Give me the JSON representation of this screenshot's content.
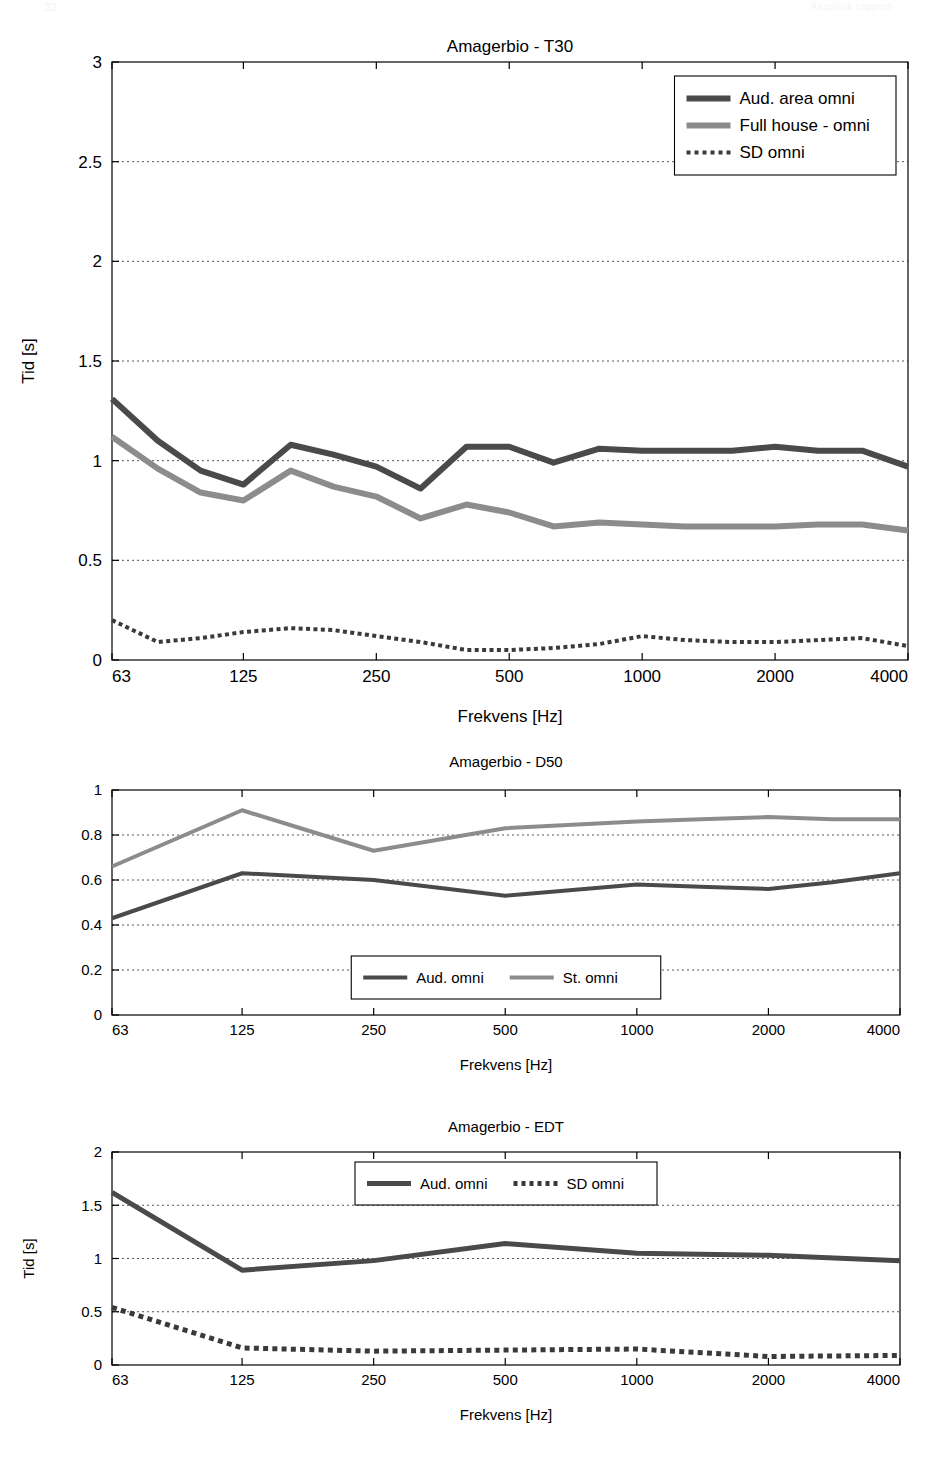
{
  "header": {
    "left_mark": "32",
    "right_mark": "Akustisk rapport"
  },
  "figures": [
    {
      "id": "fig-t30",
      "title": "Amagerbio - T30",
      "xlabel": "Frekvens [Hz]",
      "ylabel": "Tid [s]",
      "legend_position": "top-right",
      "chart_data": {
        "type": "line",
        "title": "Amagerbio - T30",
        "xlabel": "Frekvens [Hz]",
        "ylabel": "Tid [s]",
        "xscale": "log",
        "xlim": [
          63,
          4000
        ],
        "ylim": [
          0,
          3
        ],
        "yticks": [
          0,
          0.5,
          1,
          1.5,
          2,
          2.5,
          3
        ],
        "ytick_labels": [
          "0",
          "0.5",
          "1",
          "1.5",
          "2",
          "2.5",
          "3"
        ],
        "xticks": [
          63,
          125,
          250,
          500,
          1000,
          2000,
          4000
        ],
        "xtick_labels": [
          "63",
          "125",
          "250",
          "500",
          "1000",
          "2000",
          "4000"
        ],
        "grid": true,
        "legend": [
          "Aud. area omni",
          "Full house - omni",
          "SD omni"
        ],
        "x": [
          63,
          80,
          100,
          125,
          160,
          200,
          250,
          315,
          400,
          500,
          630,
          800,
          1000,
          1250,
          1600,
          2000,
          2500,
          3150,
          4000
        ],
        "series": [
          {
            "name": "Aud. area omni",
            "color": "#4a4a4a",
            "style": "solid",
            "width": 6,
            "values": [
              1.31,
              1.1,
              0.95,
              0.88,
              1.08,
              1.03,
              0.97,
              0.86,
              1.07,
              1.07,
              0.99,
              1.06,
              1.05,
              1.05,
              1.05,
              1.07,
              1.05,
              1.05,
              0.97
            ]
          },
          {
            "name": "Full house - omni",
            "color": "#8c8c8c",
            "style": "solid",
            "width": 6,
            "values": [
              1.12,
              0.96,
              0.84,
              0.8,
              0.95,
              0.87,
              0.82,
              0.71,
              0.78,
              0.74,
              0.67,
              0.69,
              0.68,
              0.67,
              0.67,
              0.67,
              0.68,
              0.68,
              0.65
            ]
          },
          {
            "name": "SD omni",
            "color": "#3a3a3a",
            "style": "dotted",
            "width": 4,
            "values": [
              0.2,
              0.09,
              0.11,
              0.14,
              0.16,
              0.15,
              0.12,
              0.09,
              0.05,
              0.05,
              0.06,
              0.08,
              0.12,
              0.1,
              0.09,
              0.09,
              0.1,
              0.11,
              0.07
            ]
          }
        ]
      }
    },
    {
      "id": "fig-d50",
      "title": "Amagerbio - D50",
      "xlabel": "Frekvens [Hz]",
      "ylabel": "",
      "legend_position": "bottom-center",
      "chart_data": {
        "type": "line",
        "title": "Amagerbio - D50",
        "xlabel": "Frekvens [Hz]",
        "ylabel": "",
        "xscale": "log",
        "xlim": [
          63,
          4000
        ],
        "ylim": [
          0,
          1
        ],
        "yticks": [
          0,
          0.2,
          0.4,
          0.6,
          0.8,
          1
        ],
        "ytick_labels": [
          "0",
          "0.2",
          "0.4",
          "0.6",
          "0.8",
          "1"
        ],
        "xticks": [
          63,
          125,
          250,
          500,
          1000,
          2000,
          4000
        ],
        "xtick_labels": [
          "63",
          "125",
          "250",
          "500",
          "1000",
          "2000",
          "4000"
        ],
        "grid": true,
        "legend": [
          "Aud. omni",
          "St. omni"
        ],
        "x": [
          63,
          125,
          250,
          500,
          1000,
          1400,
          2000,
          2800,
          4000
        ],
        "series": [
          {
            "name": "Aud. omni",
            "color": "#4a4a4a",
            "style": "solid",
            "width": 4,
            "values": [
              0.43,
              0.63,
              0.6,
              0.53,
              0.58,
              0.57,
              0.56,
              0.59,
              0.63
            ]
          },
          {
            "name": "St. omni",
            "color": "#8c8c8c",
            "style": "solid",
            "width": 4,
            "values": [
              0.66,
              0.91,
              0.73,
              0.83,
              0.86,
              0.87,
              0.88,
              0.87,
              0.87
            ]
          }
        ]
      }
    },
    {
      "id": "fig-edt",
      "title": "Amagerbio - EDT",
      "xlabel": "Frekvens [Hz]",
      "ylabel": "Tid [s]",
      "legend_position": "top-center",
      "chart_data": {
        "type": "line",
        "title": "Amagerbio - EDT",
        "xlabel": "Frekvens [Hz]",
        "ylabel": "Tid [s]",
        "xscale": "log",
        "xlim": [
          63,
          4000
        ],
        "ylim": [
          0,
          2
        ],
        "yticks": [
          0,
          0.5,
          1,
          1.5,
          2
        ],
        "ytick_labels": [
          "0",
          "0.5",
          "1",
          "1.5",
          "2"
        ],
        "xticks": [
          63,
          125,
          250,
          500,
          1000,
          2000,
          4000
        ],
        "xtick_labels": [
          "63",
          "125",
          "250",
          "500",
          "1000",
          "2000",
          "4000"
        ],
        "grid": true,
        "legend": [
          "Aud. omni",
          "SD omni"
        ],
        "x": [
          63,
          125,
          250,
          500,
          1000,
          2000,
          4000
        ],
        "series": [
          {
            "name": "Aud. omni",
            "color": "#4a4a4a",
            "style": "solid",
            "width": 5,
            "values": [
              1.62,
              0.89,
              0.98,
              1.14,
              1.05,
              1.03,
              0.98
            ]
          },
          {
            "name": "SD omni",
            "color": "#3a3a3a",
            "style": "dotted",
            "width": 5,
            "values": [
              0.54,
              0.16,
              0.13,
              0.14,
              0.15,
              0.08,
              0.09
            ]
          }
        ]
      }
    }
  ]
}
